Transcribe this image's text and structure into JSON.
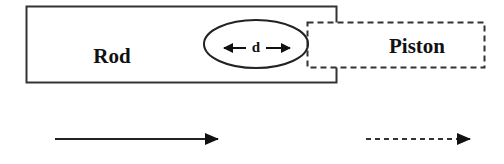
{
  "diagram": {
    "rod": {
      "label": "Rod",
      "style": "solid"
    },
    "piston": {
      "label": "Piston",
      "style": "dashed"
    },
    "overlap": {
      "label": "d",
      "description": "double-headed arrow inside ellipse marking overlap distance"
    },
    "legend": [
      {
        "style": "solid-arrow",
        "meaning": "rod"
      },
      {
        "style": "dashed-arrow",
        "meaning": "piston"
      }
    ],
    "colors": {
      "stroke": "#222222",
      "background": "#ffffff"
    }
  }
}
